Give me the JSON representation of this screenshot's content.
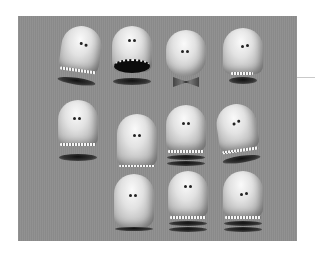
{
  "image": {
    "description": "Grayscale grid of 11 capsule-shaped 3D cartoon character heads with various mouth poses on a gray backdrop",
    "background_color": "#ffffff",
    "panel_color": "#8e8e8e",
    "rows": [
      {
        "characters": [
          {
            "id": "c1",
            "pose": "tilted head with teeth band, separated jaw below"
          },
          {
            "id": "c2",
            "pose": "wide open mouth with teeth"
          },
          {
            "id": "c3",
            "pose": "head with bowtie underneath"
          },
          {
            "id": "c4",
            "pose": "closed mouth, teeth showing, dark jaw"
          }
        ]
      },
      {
        "characters": [
          {
            "id": "c5",
            "pose": "head with floating jaw below"
          },
          {
            "id": "c6",
            "pose": "closed mouth, thin lip line"
          },
          {
            "id": "c7",
            "pose": "teeth band with layered jaw"
          },
          {
            "id": "c8",
            "pose": "tilted head with teeth band"
          }
        ]
      },
      {
        "characters": [
          {
            "id": "c9",
            "pose": "pinched chin, no teeth"
          },
          {
            "id": "c10",
            "pose": "teeth band with layered jaw"
          },
          {
            "id": "c11",
            "pose": "teeth band with layered jaw"
          }
        ]
      }
    ]
  }
}
